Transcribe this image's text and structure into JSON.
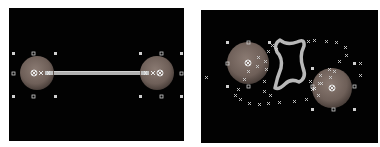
{
  "panels": [
    {
      "id": "left",
      "description": "Two spheres connected by a straight tube with selection handles",
      "sphere_color": "#7a6a62",
      "tube_color": "#b5b5b5",
      "handle_color": "#cfcfcf",
      "spheres": [
        {
          "cx": 28,
          "cy": 65,
          "r": 17
        },
        {
          "cx": 148,
          "cy": 65,
          "r": 17
        }
      ]
    },
    {
      "id": "right",
      "description": "Two spheres with scattered control points and a star-shaped outline path",
      "sphere_color": "#7a6a62",
      "path_color": "#b5b5b5",
      "marker_color": "#cfcfcf",
      "spheres": [
        {
          "cx": 47,
          "cy": 53,
          "r": 21
        },
        {
          "cx": 131,
          "cy": 78,
          "r": 20
        }
      ]
    }
  ]
}
